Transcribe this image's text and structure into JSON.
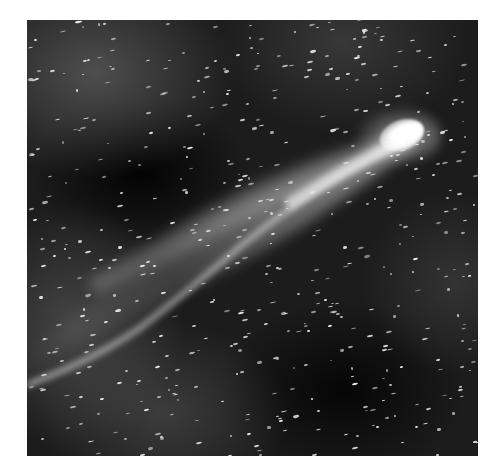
{
  "image": {
    "subject": "comet with long curved tail against star field",
    "style": "black-and-white astronomical photograph",
    "frame": {
      "x": 27,
      "y": 20,
      "width": 451,
      "height": 436,
      "background": "#ffffff"
    },
    "comet_head": {
      "x": 410,
      "y": 133
    },
    "tail_direction": "toward lower-left",
    "colors": {
      "sky_dark": "#0b0b0b",
      "sky_haze": "#5a5a5a",
      "head": "#ffffff",
      "stars": "#e9e9e9"
    }
  }
}
